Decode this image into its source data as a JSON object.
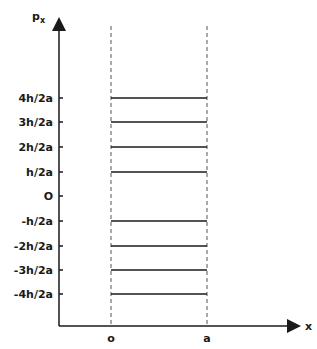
{
  "diagram": {
    "title": "",
    "y_axis": {
      "label": "p",
      "subscript": "x"
    },
    "x_axis": {
      "label": "x"
    },
    "x_ticks": [
      {
        "label": "o",
        "x": 111
      },
      {
        "label": "a",
        "x": 207
      }
    ],
    "levels": [
      {
        "label": "4h/2a",
        "y": 98,
        "line": true
      },
      {
        "label": "3h/2a",
        "y": 122,
        "line": true
      },
      {
        "label": "2h/2a",
        "y": 147,
        "line": true
      },
      {
        "label": "h/2a",
        "y": 172,
        "line": true
      },
      {
        "label": "O",
        "y": 196,
        "line": false
      },
      {
        "label": "-h/2a",
        "y": 221,
        "line": true
      },
      {
        "label": "-2h/2a",
        "y": 246,
        "line": true
      },
      {
        "label": "-3h/2a",
        "y": 270,
        "line": true
      },
      {
        "label": "-4h/2a",
        "y": 294,
        "line": true
      }
    ],
    "colors": {
      "ink": "#1a1a1a",
      "background": "#ffffff"
    }
  }
}
